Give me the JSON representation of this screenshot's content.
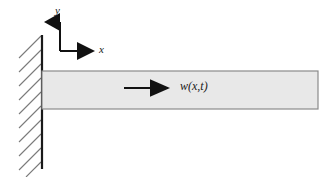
{
  "figure": {
    "kind": "cantilever-beam-diagram",
    "background_color": "#ffffff"
  },
  "axes": {
    "origin": {
      "x": 60,
      "y": 51
    },
    "y_axis": {
      "label": "y",
      "from": {
        "x": 60,
        "y": 51
      },
      "to": {
        "x": 60,
        "y": 19
      },
      "arrow": "up",
      "color": "#111111"
    },
    "x_axis": {
      "label": "x",
      "from": {
        "x": 60,
        "y": 51
      },
      "to": {
        "x": 96,
        "y": 51
      },
      "arrow": "right",
      "color": "#111111"
    }
  },
  "wall": {
    "name": "fixed-support-wall",
    "line": {
      "x": 42,
      "y_top": 35,
      "y_bottom": 169
    },
    "color": "#1a1a1a",
    "hatching": {
      "count": 10,
      "angle_deg": 45,
      "length": 24,
      "spacing": 14,
      "color": "#7a7a7a"
    }
  },
  "beam": {
    "name": "cantilever-beam",
    "x": 42,
    "y": 71,
    "width": 276,
    "height": 38,
    "fill_color": "#e8e8e8",
    "stroke_color": "#8a8a8a"
  },
  "deflection": {
    "label": "w(x,t)",
    "arrow": {
      "from": {
        "x": 124,
        "y": 88
      },
      "to": {
        "x": 172,
        "y": 88
      },
      "color": "#111111",
      "direction": "right"
    }
  }
}
